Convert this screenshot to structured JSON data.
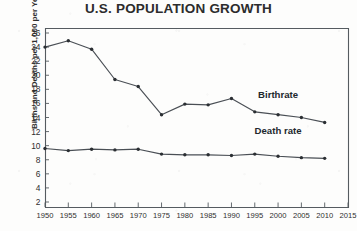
{
  "chart_data": {
    "type": "line",
    "title": "U.S. POPULATION GROWTH",
    "xlabel": "",
    "ylabel": "Births and Deaths per 1,000 per Year",
    "grid": false,
    "legend_position": "inline-right",
    "xlim": [
      1950,
      2015
    ],
    "ylim": [
      0,
      27
    ],
    "ytick_labels": [
      "26",
      "24",
      "22",
      "20",
      "18",
      "16",
      "14",
      "12",
      "10",
      "8",
      "6",
      "4",
      "2"
    ],
    "ytick_values": [
      26,
      24,
      22,
      20,
      18,
      16,
      14,
      12,
      10,
      8,
      6,
      4,
      2
    ],
    "xtick_labels": [
      "1950",
      "1955",
      "1960",
      "1965",
      "1970",
      "1975",
      "1980",
      "1985",
      "1990",
      "1995",
      "2000",
      "2005",
      "2010",
      "2015"
    ],
    "x": [
      1950,
      1955,
      1960,
      1965,
      1970,
      1975,
      1980,
      1985,
      1990,
      1995,
      2000,
      2005,
      2010
    ],
    "series": [
      {
        "name": "Birthrate",
        "label": "Birthrate",
        "values": [
          24.0,
          24.9,
          23.7,
          19.4,
          18.4,
          14.4,
          15.9,
          15.8,
          16.7,
          14.8,
          14.4,
          14.0,
          13.3
        ]
      },
      {
        "name": "Death rate",
        "label": "Death rate",
        "values": [
          9.6,
          9.3,
          9.5,
          9.4,
          9.5,
          8.8,
          8.7,
          8.7,
          8.6,
          8.8,
          8.5,
          8.3,
          8.2
        ]
      }
    ],
    "annotations": [
      {
        "text": "Birthrate",
        "x": 2000,
        "y": 16.8
      },
      {
        "text": "Death rate",
        "x": 2000,
        "y": 11.6
      }
    ]
  }
}
